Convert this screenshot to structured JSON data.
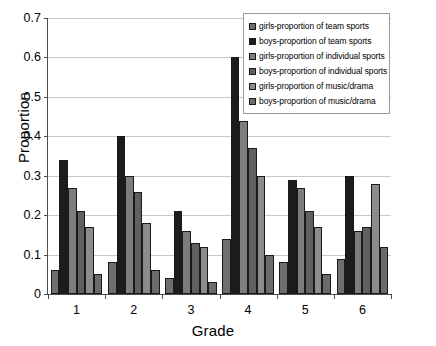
{
  "chart_data": {
    "type": "bar",
    "title": "",
    "subtitle": "",
    "xlabel": "Grade",
    "ylabel": "Proportion",
    "categories": [
      "1",
      "2",
      "3",
      "4",
      "5",
      "6"
    ],
    "ylim": [
      0,
      0.7
    ],
    "yticks": [
      "0",
      "0.1",
      "0.2",
      "0.3",
      "0.4",
      "0.5",
      "0.6",
      "0.7"
    ],
    "ytick_values": [
      0,
      0.1,
      0.2,
      0.3,
      0.4,
      0.5,
      0.6,
      0.7
    ],
    "grid": "horizontal",
    "legend_position": "top-right",
    "series": [
      {
        "name": "girls-proportion of team sports",
        "color": "#6e6e6e",
        "values": [
          0.06,
          0.08,
          0.04,
          0.14,
          0.08,
          0.09
        ]
      },
      {
        "name": "boys-proportion of team sports",
        "color": "#1c1c1c",
        "values": [
          0.34,
          0.4,
          0.21,
          0.6,
          0.29,
          0.3
        ]
      },
      {
        "name": "girls-proportion of individual sports",
        "color": "#7d7d7d",
        "values": [
          0.27,
          0.3,
          0.16,
          0.44,
          0.27,
          0.16
        ]
      },
      {
        "name": "boys-proportion of individual sports",
        "color": "#606060",
        "values": [
          0.21,
          0.26,
          0.13,
          0.37,
          0.21,
          0.17
        ]
      },
      {
        "name": "girls-proportion of music/drama",
        "color": "#8c8c8c",
        "values": [
          0.17,
          0.18,
          0.12,
          0.3,
          0.17,
          0.28
        ]
      },
      {
        "name": "boys-proportion of music/drama",
        "color": "#6b6b6b",
        "values": [
          0.05,
          0.06,
          0.03,
          0.1,
          0.05,
          0.12
        ]
      }
    ]
  }
}
